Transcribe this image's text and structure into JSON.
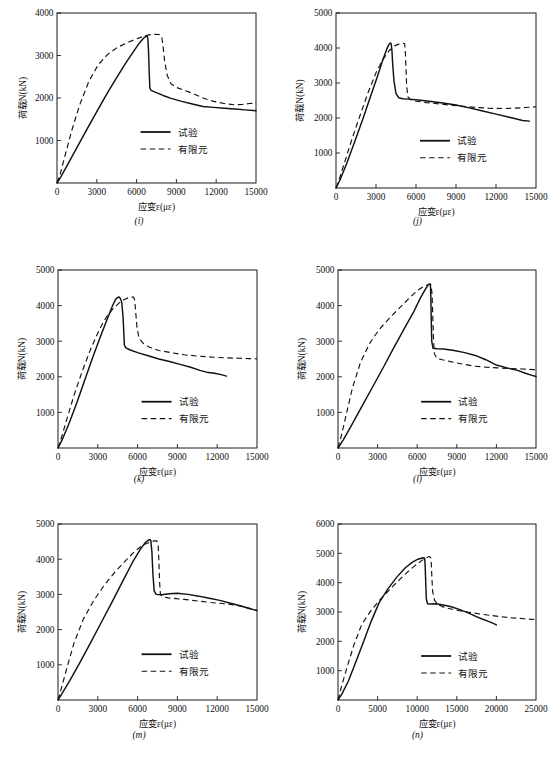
{
  "figure": {
    "panel_labels": [
      "(i)",
      "(j)",
      "(k)",
      "(l)",
      "(m)",
      "(n)"
    ]
  },
  "labels": {
    "ylabel": "荷载N(kN)",
    "xlabel": "应变ε(με)",
    "legend_test": "试验",
    "legend_fem": "有限元"
  },
  "chart_data": [
    {
      "id": "i",
      "type": "line",
      "title": "(i)",
      "xlabel": "应变ε(με)",
      "ylabel": "荷载N(kN)",
      "xlim": [
        0,
        15000
      ],
      "ylim": [
        0,
        4000
      ],
      "xticks": [
        0,
        3000,
        6000,
        9000,
        12000,
        15000
      ],
      "yticks": [
        0,
        1000,
        2000,
        3000,
        4000
      ],
      "grid": false,
      "legend_position": "lower-right",
      "series": [
        {
          "name": "试验",
          "style": "solid",
          "x": [
            0,
            300,
            800,
            1500,
            2200,
            3000,
            3800,
            4500,
            5200,
            5800,
            6200,
            6500,
            6700,
            6800,
            6850,
            6900,
            6950,
            7000,
            7100,
            7400,
            8000,
            8600,
            9400,
            10200,
            11000,
            11800,
            12600,
            13400,
            14200,
            15000
          ],
          "y": [
            0,
            150,
            430,
            830,
            1230,
            1680,
            2120,
            2480,
            2830,
            3110,
            3290,
            3400,
            3450,
            3455,
            3400,
            3100,
            2600,
            2230,
            2180,
            2140,
            2060,
            1990,
            1920,
            1860,
            1800,
            1780,
            1760,
            1740,
            1720,
            1700
          ]
        },
        {
          "name": "有限元",
          "style": "dashed",
          "x": [
            0,
            250,
            600,
            1100,
            1700,
            2400,
            3100,
            3800,
            4500,
            5200,
            5900,
            6500,
            7000,
            7400,
            7700,
            7900,
            8000,
            8100,
            8300,
            8600,
            9000,
            9600,
            10300,
            11000,
            11800,
            12600,
            13400,
            14000,
            14500,
            15000
          ],
          "y": [
            0,
            220,
            640,
            1220,
            1830,
            2390,
            2780,
            3020,
            3180,
            3290,
            3380,
            3450,
            3490,
            3500,
            3495,
            3440,
            3200,
            2900,
            2540,
            2330,
            2250,
            2180,
            2100,
            2000,
            1920,
            1870,
            1840,
            1850,
            1870,
            1880
          ]
        }
      ]
    },
    {
      "id": "j",
      "type": "line",
      "title": "(j)",
      "xlabel": "应变ε(με)",
      "ylabel": "荷载N(kN)",
      "xlim": [
        0,
        15000
      ],
      "ylim": [
        0,
        5000
      ],
      "xticks": [
        0,
        3000,
        6000,
        9000,
        12000,
        15000
      ],
      "yticks": [
        0,
        1000,
        2000,
        3000,
        4000,
        5000
      ],
      "grid": false,
      "legend_position": "lower-right",
      "series": [
        {
          "name": "试验",
          "style": "solid",
          "x": [
            0,
            300,
            800,
            1400,
            2000,
            2600,
            3100,
            3500,
            3800,
            3950,
            4050,
            4100,
            4150,
            4200,
            4250,
            4350,
            4500,
            4700,
            5000,
            5400,
            6000,
            7000,
            8000,
            9000,
            10000,
            11000,
            12000,
            13000,
            14000,
            14500
          ],
          "y": [
            0,
            230,
            700,
            1320,
            1960,
            2630,
            3180,
            3650,
            3960,
            4090,
            4140,
            4145,
            4090,
            3900,
            3550,
            3050,
            2700,
            2580,
            2550,
            2540,
            2520,
            2480,
            2430,
            2370,
            2290,
            2200,
            2110,
            2020,
            1930,
            1910
          ]
        },
        {
          "name": "有限元",
          "style": "dashed",
          "x": [
            0,
            250,
            650,
            1200,
            1800,
            2400,
            3000,
            3500,
            4000,
            4400,
            4700,
            4900,
            5050,
            5150,
            5200,
            5250,
            5300,
            5400,
            5600,
            6000,
            6800,
            7800,
            9000,
            10200,
            11400,
            12500,
            13400,
            14200,
            14700,
            15000
          ],
          "y": [
            0,
            260,
            740,
            1400,
            2070,
            2720,
            3290,
            3660,
            3930,
            4060,
            4110,
            4130,
            4135,
            4120,
            3900,
            3400,
            2900,
            2600,
            2520,
            2480,
            2440,
            2400,
            2350,
            2310,
            2280,
            2270,
            2280,
            2300,
            2310,
            2320
          ]
        }
      ]
    },
    {
      "id": "k",
      "type": "line",
      "title": "(k)",
      "xlabel": "应变ε(με)",
      "ylabel": "荷载N(kN)",
      "xlim": [
        0,
        15000
      ],
      "ylim": [
        0,
        5000
      ],
      "xticks": [
        0,
        3000,
        6000,
        9000,
        12000,
        15000
      ],
      "yticks": [
        0,
        1000,
        2000,
        3000,
        4000,
        5000
      ],
      "grid": false,
      "legend_position": "lower-right",
      "series": [
        {
          "name": "试验",
          "style": "solid",
          "x": [
            0,
            300,
            800,
            1400,
            2000,
            2600,
            3200,
            3700,
            4100,
            4350,
            4500,
            4600,
            4700,
            4800,
            4900,
            4960,
            5000,
            5100,
            5400,
            6000,
            6800,
            7600,
            8400,
            9200,
            10000,
            10700,
            11200,
            11800,
            12300,
            12700
          ],
          "y": [
            0,
            220,
            660,
            1250,
            1890,
            2530,
            3130,
            3610,
            3990,
            4180,
            4230,
            4240,
            4200,
            4100,
            3700,
            3250,
            2900,
            2820,
            2760,
            2680,
            2590,
            2500,
            2430,
            2350,
            2270,
            2180,
            2130,
            2100,
            2060,
            2020
          ]
        },
        {
          "name": "有限元",
          "style": "dashed",
          "x": [
            0,
            250,
            650,
            1200,
            1800,
            2400,
            2950,
            3400,
            3800,
            4200,
            4600,
            5000,
            5300,
            5550,
            5700,
            5780,
            5850,
            5950,
            6100,
            6400,
            6900,
            7600,
            8500,
            9500,
            10600,
            11700,
            12800,
            13700,
            14400,
            15000
          ],
          "y": [
            0,
            280,
            790,
            1470,
            2130,
            2720,
            3190,
            3530,
            3760,
            3930,
            4070,
            4170,
            4220,
            4240,
            4240,
            4150,
            3850,
            3400,
            3100,
            2950,
            2830,
            2740,
            2680,
            2620,
            2580,
            2550,
            2530,
            2520,
            2510,
            2505
          ]
        }
      ]
    },
    {
      "id": "l",
      "type": "line",
      "title": "(l)",
      "xlabel": "应变ε(με)",
      "ylabel": "荷载N(kN)",
      "xlim": [
        0,
        15000
      ],
      "ylim": [
        0,
        5000
      ],
      "xticks": [
        0,
        3000,
        6000,
        9000,
        12000,
        15000
      ],
      "yticks": [
        0,
        1000,
        2000,
        3000,
        4000,
        5000
      ],
      "grid": false,
      "legend_position": "lower-right",
      "series": [
        {
          "name": "试验",
          "style": "solid",
          "x": [
            0,
            400,
            1000,
            1800,
            2600,
            3400,
            4200,
            5000,
            5700,
            6200,
            6600,
            6850,
            6950,
            7000,
            7030,
            7060,
            7100,
            7200,
            7500,
            8000,
            8800,
            9600,
            10400,
            11200,
            12000,
            12800,
            13600,
            14200,
            14700,
            15000
          ],
          "y": [
            0,
            230,
            620,
            1160,
            1700,
            2240,
            2800,
            3340,
            3800,
            4180,
            4450,
            4590,
            4610,
            4600,
            4300,
            3700,
            3000,
            2800,
            2790,
            2780,
            2740,
            2680,
            2600,
            2480,
            2330,
            2250,
            2180,
            2100,
            2040,
            2010
          ]
        },
        {
          "name": "有限元",
          "style": "dashed",
          "x": [
            0,
            250,
            600,
            1100,
            1700,
            2400,
            3100,
            3900,
            4700,
            5400,
            6000,
            6500,
            6900,
            7050,
            7130,
            7180,
            7230,
            7300,
            7500,
            7900,
            8600,
            9400,
            10300,
            11200,
            12100,
            13000,
            13900,
            14500,
            14800,
            15000
          ],
          "y": [
            0,
            340,
            900,
            1700,
            2400,
            2940,
            3320,
            3650,
            3950,
            4210,
            4420,
            4540,
            4600,
            4580,
            4300,
            3700,
            3100,
            2650,
            2520,
            2480,
            2420,
            2360,
            2300,
            2270,
            2250,
            2230,
            2220,
            2210,
            2200,
            2200
          ]
        }
      ]
    },
    {
      "id": "m",
      "type": "line",
      "title": "(m)",
      "xlabel": "应变ε(με)",
      "ylabel": "荷载N(kN)",
      "xlim": [
        0,
        15000
      ],
      "ylim": [
        0,
        5000
      ],
      "xticks": [
        0,
        3000,
        6000,
        9000,
        12000,
        15000
      ],
      "yticks": [
        0,
        1000,
        2000,
        3000,
        4000,
        5000
      ],
      "grid": false,
      "legend_position": "lower-right",
      "series": [
        {
          "name": "试验",
          "style": "solid",
          "x": [
            0,
            300,
            900,
            1700,
            2500,
            3300,
            4100,
            4900,
            5600,
            6200,
            6600,
            6850,
            6950,
            7000,
            7080,
            7150,
            7250,
            7400,
            7800,
            8400,
            9000,
            9800,
            10600,
            11400,
            12200,
            13000,
            13800,
            14400,
            14800,
            15000
          ],
          "y": [
            0,
            180,
            560,
            1100,
            1660,
            2230,
            2800,
            3390,
            3900,
            4280,
            4480,
            4550,
            4555,
            4520,
            4200,
            3600,
            3100,
            3000,
            2990,
            3020,
            3030,
            3000,
            2950,
            2890,
            2830,
            2750,
            2670,
            2600,
            2560,
            2540
          ]
        },
        {
          "name": "有限元",
          "style": "dashed",
          "x": [
            0,
            250,
            650,
            1200,
            1900,
            2700,
            3500,
            4300,
            5100,
            5800,
            6400,
            6900,
            7250,
            7450,
            7550,
            7600,
            7650,
            7720,
            7900,
            8300,
            8900,
            9700,
            10600,
            11500,
            12400,
            13300,
            14100,
            14600,
            14900,
            15000
          ],
          "y": [
            0,
            330,
            880,
            1610,
            2290,
            2830,
            3270,
            3640,
            3960,
            4230,
            4400,
            4480,
            4520,
            4520,
            4400,
            4000,
            3400,
            3000,
            2930,
            2900,
            2880,
            2850,
            2810,
            2770,
            2740,
            2700,
            2640,
            2590,
            2560,
            2550
          ]
        }
      ]
    },
    {
      "id": "n",
      "type": "line",
      "title": "(n)",
      "xlabel": "应变ε(με)",
      "ylabel": "荷载N(kN)",
      "xlim": [
        0,
        25000
      ],
      "ylim": [
        0,
        6000
      ],
      "xticks": [
        0,
        5000,
        10000,
        15000,
        20000,
        25000
      ],
      "yticks": [
        0,
        1000,
        2000,
        3000,
        4000,
        5000,
        6000
      ],
      "grid": false,
      "legend_position": "lower-right",
      "series": [
        {
          "name": "试验",
          "style": "solid",
          "x": [
            0,
            500,
            1300,
            2200,
            3200,
            4200,
            5200,
            6300,
            7400,
            8500,
            9400,
            10100,
            10600,
            10850,
            10950,
            11000,
            11080,
            11150,
            11300,
            11700,
            12400,
            13300,
            14300,
            15400,
            16500,
            17400,
            18200,
            19000,
            19600,
            20000
          ],
          "y": [
            0,
            210,
            640,
            1260,
            1970,
            2690,
            3320,
            3790,
            4180,
            4510,
            4700,
            4800,
            4840,
            4850,
            4820,
            4600,
            4000,
            3450,
            3280,
            3270,
            3280,
            3240,
            3180,
            3080,
            2960,
            2850,
            2760,
            2680,
            2610,
            2560
          ]
        },
        {
          "name": "有限元",
          "style": "dashed",
          "x": [
            0,
            400,
            1100,
            2000,
            3000,
            4100,
            5200,
            6400,
            7600,
            8800,
            9800,
            10600,
            11200,
            11550,
            11700,
            11780,
            11850,
            11950,
            12200,
            12700,
            13500,
            14600,
            15800,
            17000,
            18200,
            19400,
            20600,
            22000,
            23500,
            25000
          ],
          "y": [
            0,
            420,
            1080,
            1870,
            2580,
            3020,
            3390,
            3730,
            4060,
            4370,
            4600,
            4760,
            4860,
            4890,
            4850,
            4650,
            4200,
            3700,
            3400,
            3240,
            3150,
            3080,
            3020,
            2970,
            2920,
            2880,
            2840,
            2800,
            2770,
            2740
          ]
        }
      ]
    }
  ]
}
